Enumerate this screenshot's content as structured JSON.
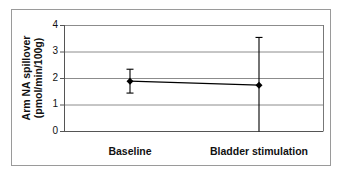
{
  "chart_data": {
    "type": "line",
    "title": "",
    "xlabel": "",
    "ylabel": "Arm NA spillover (pmol/min/100g)",
    "ylabel_lines": [
      "Arm NA spillover",
      "(pmol/min/100g)"
    ],
    "categories": [
      "Baseline",
      "Bladder stimulation"
    ],
    "series": [
      {
        "name": "Arm NA spillover",
        "values": [
          1.9,
          1.75
        ],
        "error_upper": [
          2.35,
          3.55
        ],
        "error_lower": [
          1.45,
          0.0
        ],
        "marker": "diamond",
        "color": "#000000"
      }
    ],
    "ylim": [
      0,
      4
    ],
    "yticks": [
      0,
      1,
      2,
      3,
      4
    ],
    "grid": true,
    "legend": "none"
  },
  "axis": {
    "yticks": [
      "0",
      "1",
      "2",
      "3",
      "4"
    ],
    "ylabel_line1": "Arm NA spillover",
    "ylabel_line2": "(pmol/min/100g)",
    "xcats": [
      "Baseline",
      "Bladder stimulation"
    ]
  },
  "colors": {
    "grid": "#8c8c8c",
    "axis": "#555555",
    "series": "#000000",
    "frame": "#9a9a9a"
  }
}
